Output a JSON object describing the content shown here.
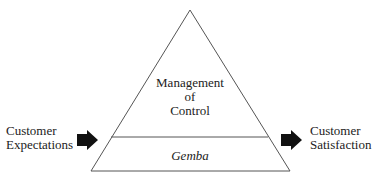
{
  "diagram": {
    "type": "pyramid",
    "upper_section": {
      "lines": [
        "Management",
        "of",
        "Control"
      ]
    },
    "lower_section": {
      "label": "Gemba"
    },
    "input": {
      "lines": [
        "Customer",
        "Expectations"
      ],
      "arrow": "right-arrow"
    },
    "output": {
      "lines": [
        "Customer",
        "Satisfaction"
      ],
      "arrow": "right-arrow"
    },
    "colors": {
      "stroke": "#555555",
      "arrow": "#111111",
      "text": "#222222",
      "background": "#ffffff"
    }
  }
}
